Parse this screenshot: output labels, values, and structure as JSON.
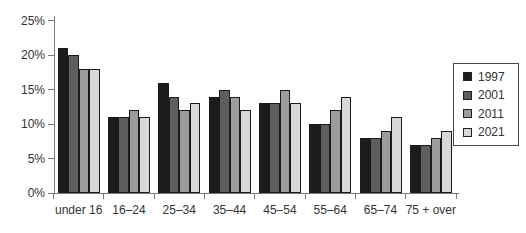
{
  "chart_data": {
    "type": "bar",
    "title": "",
    "xlabel": "",
    "ylabel": "",
    "grid": false,
    "legend_position": "right-inside",
    "ylim": [
      0,
      25
    ],
    "yticks": [
      {
        "value": 0,
        "label": "0%"
      },
      {
        "value": 5,
        "label": "5%"
      },
      {
        "value": 10,
        "label": "10%"
      },
      {
        "value": 15,
        "label": "15%"
      },
      {
        "value": 20,
        "label": "20%"
      },
      {
        "value": 25,
        "label": "25%"
      }
    ],
    "categories": [
      "under 16",
      "16–24",
      "25–34",
      "35–44",
      "45–54",
      "55–64",
      "65–74",
      "75 + over"
    ],
    "series": [
      {
        "name": "1997",
        "color": "#1c1c1c",
        "values": [
          21,
          11,
          16,
          14,
          13,
          10,
          8,
          7
        ]
      },
      {
        "name": "2001",
        "color": "#5e5e5e",
        "values": [
          20,
          11,
          14,
          15,
          13,
          10,
          8,
          7
        ]
      },
      {
        "name": "2011",
        "color": "#9c9c9c",
        "values": [
          18,
          12,
          12,
          14,
          15,
          12,
          9,
          8
        ]
      },
      {
        "name": "2021",
        "color": "#d8d8d8",
        "values": [
          18,
          11,
          13,
          12,
          13,
          14,
          11,
          9
        ]
      }
    ],
    "colors": {
      "axis": "#7a7a7a",
      "text": "#333333",
      "bar_border": "#1a1a1a",
      "legend_border": "#4a4a4a",
      "background": "#ffffff"
    }
  }
}
